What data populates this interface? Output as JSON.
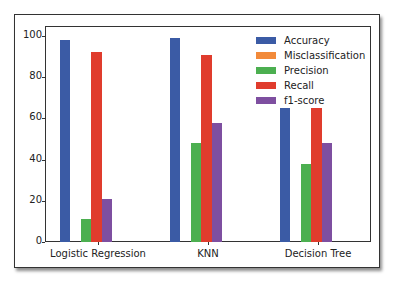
{
  "chart_data": {
    "type": "bar",
    "title": "",
    "xlabel": "",
    "ylabel": "",
    "categories": [
      "Logistic Regression",
      "KNN",
      "Decision Tree"
    ],
    "series": [
      {
        "name": "Accuracy",
        "color": "#3b5ba5",
        "values": [
          98,
          99,
          65
        ]
      },
      {
        "name": "Misclassification",
        "color": "#f28a3a",
        "values": [
          2,
          1,
          35
        ]
      },
      {
        "name": "Precision",
        "color": "#4caf50",
        "values": [
          11,
          48,
          38
        ]
      },
      {
        "name": "Recall",
        "color": "#e03c2d",
        "values": [
          92,
          91,
          65
        ]
      },
      {
        "name": "f1-score",
        "color": "#7e4fa0",
        "values": [
          21,
          58,
          48
        ]
      }
    ],
    "ylim": [
      0,
      103
    ],
    "yticks": [
      0,
      20,
      40,
      60,
      80,
      100
    ],
    "grid": false,
    "legend_position": "upper right"
  }
}
